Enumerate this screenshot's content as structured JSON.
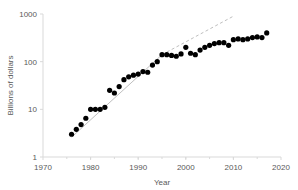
{
  "chart_data": {
    "type": "scatter",
    "title": "",
    "xlabel": "Year",
    "ylabel": "Billions of dollars",
    "yscale": "log",
    "xlim": [
      1970,
      2020
    ],
    "ylim": [
      1,
      1000
    ],
    "grid": false,
    "legend": "none",
    "xticks": [
      "1970",
      "1980",
      "1990",
      "2000",
      "2010",
      "2020"
    ],
    "xtick_values": [
      1970,
      1980,
      1990,
      2000,
      2010,
      2020
    ],
    "yticks": [
      "1",
      "10",
      "100",
      "1000"
    ],
    "ytick_values": [
      1,
      10,
      100,
      1000
    ],
    "series": [
      {
        "name": "Billions of dollars",
        "marker": "filled-circle",
        "color": "#000000",
        "x": [
          1976,
          1977,
          1978,
          1979,
          1980,
          1981,
          1982,
          1983,
          1984,
          1985,
          1986,
          1987,
          1988,
          1989,
          1990,
          1991,
          1992,
          1993,
          1994,
          1995,
          1996,
          1997,
          1998,
          1999,
          2000,
          2001,
          2002,
          2003,
          2004,
          2005,
          2006,
          2007,
          2008,
          2009,
          2010,
          2011,
          2012,
          2013,
          2014,
          2015,
          2016,
          2017
        ],
        "y": [
          3.0,
          3.8,
          4.8,
          6.5,
          10.0,
          10.0,
          10.0,
          11.0,
          25.0,
          22.0,
          30.0,
          42.0,
          48.0,
          52.0,
          55.0,
          62.0,
          60.0,
          85.0,
          100.0,
          140.0,
          140.0,
          135.0,
          130.0,
          145.0,
          200.0,
          150.0,
          140.0,
          175.0,
          200.0,
          220.0,
          240.0,
          250.0,
          250.0,
          220.0,
          290.0,
          300.0,
          290.0,
          300.0,
          320.0,
          330.0,
          320.0,
          400.0
        ]
      }
    ],
    "annotations": [
      {
        "name": "exponential-trend-line",
        "style": "solid",
        "color": "#bfbfbf",
        "x": [
          1976,
          1995
        ],
        "y": [
          2.6,
          140.0
        ]
      },
      {
        "name": "exponential-trend-extrapolation",
        "style": "dashed",
        "color": "#bfbfbf",
        "x": [
          1995,
          2010
        ],
        "y": [
          140.0,
          900.0
        ]
      }
    ]
  },
  "axis": {
    "x_title": "Year",
    "y_title": "Billions of dollars"
  }
}
